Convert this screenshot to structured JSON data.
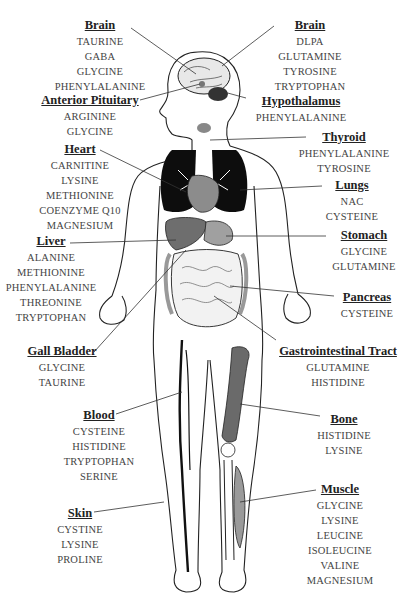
{
  "diagram": {
    "colors": {
      "text": "#444444",
      "title": "#222222",
      "organ_dark": "#111111",
      "organ_gray": "#7a7a7a",
      "organ_light": "#b5b5b5",
      "line": "#333333"
    },
    "labels": [
      {
        "id": "brain-left",
        "title": "Brain",
        "items": [
          "TAURINE",
          "GABA",
          "GLYCINE",
          "PHENYLALANINE"
        ]
      },
      {
        "id": "brain-right",
        "title": "Brain",
        "items": [
          "DLPA",
          "GLUTAMINE",
          "TYROSINE",
          "TRYPTOPHAN"
        ]
      },
      {
        "id": "anterior-pituitary",
        "title": "Anterior Pituitary",
        "items": [
          "ARGININE",
          "GLYCINE"
        ]
      },
      {
        "id": "hypothalamus",
        "title": "Hypothalamus",
        "items": [
          "PHENYLALANINE"
        ]
      },
      {
        "id": "thyroid",
        "title": "Thyroid",
        "items": [
          "PHENYLALANINE",
          "TYROSINE"
        ]
      },
      {
        "id": "heart",
        "title": "Heart",
        "items": [
          "CARNITINE",
          "LYSINE",
          "METHIONINE",
          "COENZYME Q10",
          "MAGNESIUM"
        ]
      },
      {
        "id": "lungs",
        "title": "Lungs",
        "items": [
          "NAC",
          "CYSTEINE"
        ]
      },
      {
        "id": "stomach",
        "title": "Stomach",
        "items": [
          "GLYCINE",
          "GLUTAMINE"
        ]
      },
      {
        "id": "liver",
        "title": "Liver",
        "items": [
          "ALANINE",
          "METHIONINE",
          "PHENYLALANINE",
          "THREONINE",
          "TRYPTOPHAN"
        ]
      },
      {
        "id": "pancreas",
        "title": "Pancreas",
        "items": [
          "CYSTEINE"
        ]
      },
      {
        "id": "gall-bladder",
        "title": "Gall Bladder",
        "items": [
          "GLYCINE",
          "TAURINE"
        ]
      },
      {
        "id": "gastrointestinal-tract",
        "title": "Gastrointestinal Tract",
        "items": [
          "GLUTAMINE",
          "HISTIDINE"
        ]
      },
      {
        "id": "blood",
        "title": "Blood",
        "items": [
          "CYSTEINE",
          "HISTIDINE",
          "TRYPTOPHAN",
          "SERINE"
        ]
      },
      {
        "id": "bone",
        "title": "Bone",
        "items": [
          "HISTIDINE",
          "LYSINE"
        ]
      },
      {
        "id": "skin",
        "title": "Skin",
        "items": [
          "CYSTINE",
          "LYSINE",
          "PROLINE"
        ]
      },
      {
        "id": "muscle",
        "title": "Muscle",
        "items": [
          "GLYCINE",
          "LYSINE",
          "LEUCINE",
          "ISOLEUCINE",
          "VALINE",
          "MAGNESIUM"
        ]
      }
    ]
  }
}
